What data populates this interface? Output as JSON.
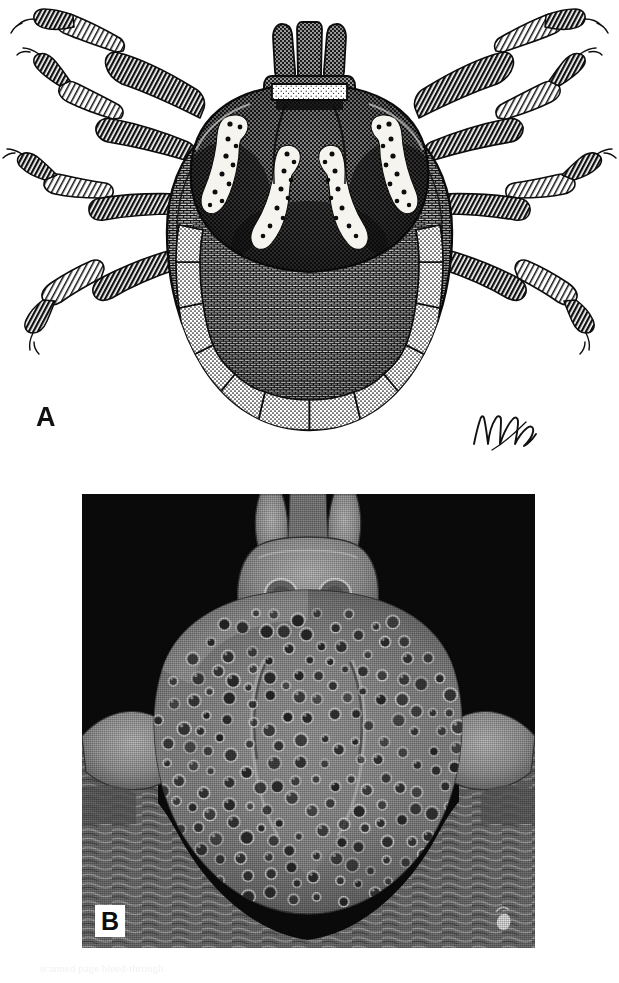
{
  "figure": {
    "type": "two-panel scientific plate",
    "background_color": "#ffffff"
  },
  "panel_a": {
    "label": "A",
    "kind": "pen-and-ink stipple illustration",
    "view": "dorsal habitus",
    "signature_present": true,
    "signature_text": "nm",
    "features": {
      "capitulum": "anterior, with paired palps and central hypostome",
      "scutum": "ornate, dark with four pale ornamentation patches",
      "legs": 8,
      "festoons": 11,
      "body_outline": "broad oval idiosoma"
    },
    "colors": {
      "ink": "#111111",
      "paper": "#ffffff",
      "ornamentation": "#f6f4ee"
    }
  },
  "panel_b": {
    "label": "B",
    "kind": "scanning electron micrograph",
    "view": "scutum and capitulum, dorsal",
    "background_color": "#0a0a0a",
    "features": {
      "basis_capituli": "with paired porose areas",
      "scutum_surface": "densely punctate",
      "punctations_visible": 180,
      "cervical_grooves": "paired, converging anteriorly",
      "alloscutum": "striated integument posterior to scutum"
    },
    "label_box_color": "#ffffff",
    "label_text_color": "#0d0d0d"
  },
  "page": {
    "bleed_text": "scanned page bleed-through"
  }
}
